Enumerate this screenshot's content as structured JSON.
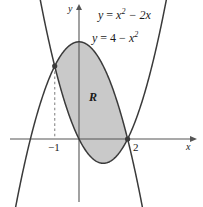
{
  "figure": {
    "kind": "math-region-diagram",
    "background": "#ffffff"
  },
  "axes": {
    "x_axis_label": "x",
    "y_axis_label": "y",
    "x_axis_pixel_y": 139,
    "y_axis_pixel_x": 79,
    "pixels_per_unit": 24.3,
    "x_view": [
      -2.85,
      4.6
    ],
    "y_view": [
      -2.45,
      5.7
    ],
    "axis_color": "#555555",
    "ticks": [
      {
        "label": "−1",
        "value": -1
      },
      {
        "label": "2",
        "value": 2
      }
    ]
  },
  "region": {
    "label": "R",
    "fill_color": "#c9c9c9",
    "from_x": -1,
    "to_x": 2
  },
  "curves": [
    {
      "name": "upward-parabola",
      "label_parts": {
        "lhs": "y",
        "eq": "=",
        "base": "x",
        "exp": "2",
        "rest": "− 2x"
      },
      "label_text": "y = x² − 2x",
      "a": 1,
      "b": -2,
      "c": 0,
      "color": "#3a3a3a"
    },
    {
      "name": "downward-parabola",
      "label_parts": {
        "lhs": "y",
        "eq": "=",
        "const": "4",
        "minus": "−",
        "base": "x",
        "exp": "2"
      },
      "label_text": "y = 4 − x²",
      "a": -1,
      "b": 0,
      "c": 4,
      "color": "#3a3a3a"
    }
  ],
  "intersections": [
    {
      "x": -1,
      "y": 3,
      "dot": true,
      "dropline": true
    },
    {
      "x": 2,
      "y": 0,
      "dot": true,
      "dropline": false
    }
  ],
  "dropline": {
    "style": "dashed",
    "color": "#9a9a9a",
    "from_x": -1
  }
}
